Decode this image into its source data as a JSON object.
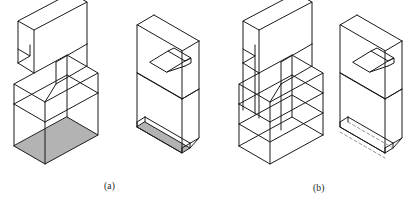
{
  "figure": {
    "background_color": "#ffffff",
    "line_color": "#1a1a1a",
    "shade_color": "#b3b3b3",
    "hidden_line_color": "#8a8a8a",
    "captions": [
      {
        "id": "a",
        "label": "(a)",
        "x": 104,
        "y": 181,
        "description": "Shaded-base pictorials"
      },
      {
        "id": "b",
        "label": "(b)",
        "x": 313,
        "y": 183,
        "description": "Wireframe pictorials with hidden lines"
      }
    ],
    "objects": [
      {
        "id": "obj-1",
        "name": "stepped-block-shaded",
        "group": "a",
        "style": "shaded-base",
        "shaded_faces": 1,
        "hidden_lines": false
      },
      {
        "id": "obj-2",
        "name": "slotted-slab-shaded",
        "group": "a",
        "style": "shaded-base",
        "shaded_faces": 1,
        "hidden_lines": false
      },
      {
        "id": "obj-3",
        "name": "stepped-block-wireframe",
        "group": "b",
        "style": "wireframe",
        "shaded_faces": 0,
        "hidden_lines": true
      },
      {
        "id": "obj-4",
        "name": "slotted-slab-wireframe",
        "group": "b",
        "style": "wireframe",
        "shaded_faces": 0,
        "hidden_lines": true
      }
    ]
  }
}
